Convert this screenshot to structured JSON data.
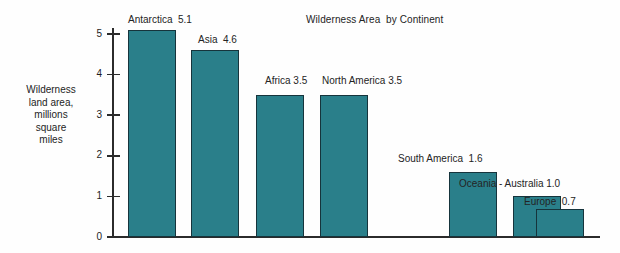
{
  "chart_data": {
    "type": "bar",
    "title": "Wilderness Area  by Continent",
    "xlabel": "",
    "ylabel": "Wilderness\nland area,\nmillions\nsquare\nmiles",
    "ylim": [
      0,
      5.2
    ],
    "yticks": [
      "0",
      "1",
      "2",
      "3",
      "4",
      "5"
    ],
    "grid": false,
    "legend": "none",
    "categories": [
      "Antarctica",
      "Asia",
      "Africa",
      "North America",
      "South America",
      "Oceania - Australia",
      "Europe"
    ],
    "values": [
      5.1,
      4.6,
      3.5,
      3.5,
      1.6,
      1.0,
      0.7
    ],
    "bar_labels": [
      "Antarctica  5.1",
      "Asia  4.6",
      "Africa 3.5",
      "North America 3.5",
      "South America  1.6",
      "Oceania - Australia 1.0",
      "Europe  0.7"
    ],
    "bar_color": "#2a7f8a",
    "bar_border_color": "#16343c",
    "axis_color": "#2b2b2b",
    "background_color": "#fefefe"
  }
}
